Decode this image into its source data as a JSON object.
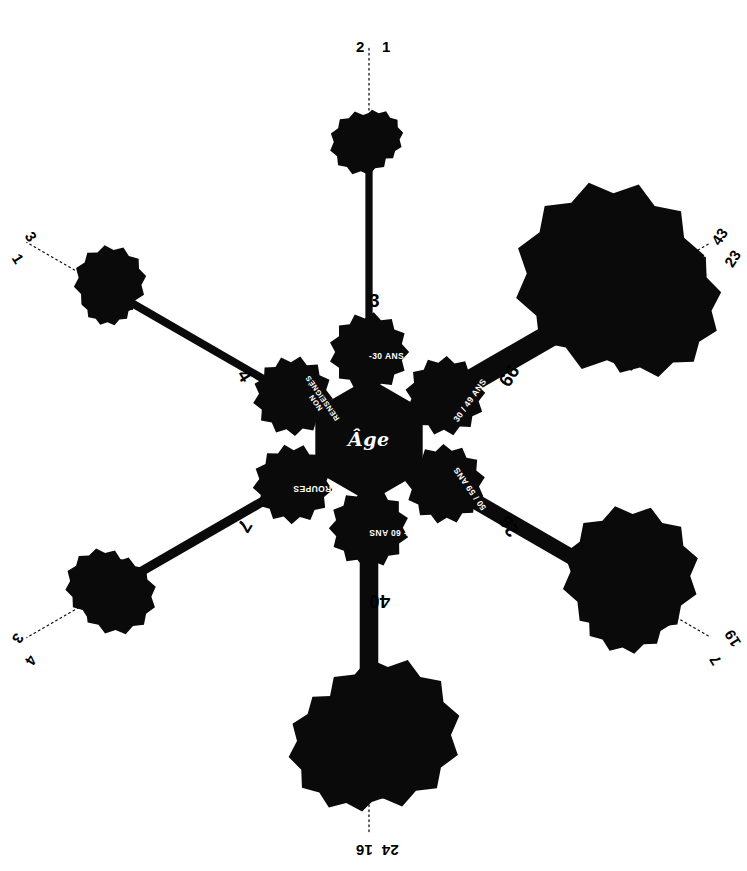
{
  "diagram": {
    "title_center": "Âge",
    "type": "radial-bubble-network",
    "accent_color": "#000000",
    "background_color": "#ffffff"
  },
  "hub": {
    "label": "Âge"
  },
  "nodes": [
    {
      "id": "n-30",
      "label": "-30 ANS",
      "angle_deg": -90,
      "value_main": 3,
      "rotation": 0,
      "lines": [
        "-30 ANS"
      ]
    },
    {
      "id": "n3049",
      "label": "30 / 49 ANS",
      "angle_deg": -30,
      "value_main": 66,
      "rotation": -55,
      "lines": [
        "30 / 49 ANS"
      ]
    },
    {
      "id": "n5059",
      "label": "50 / 59 ANS",
      "angle_deg": 30,
      "value_main": 26,
      "rotation": -125,
      "lines": [
        "50 / 59 ANS"
      ]
    },
    {
      "id": "n60",
      "label": "+ 60 ANS",
      "angle_deg": 90,
      "value_main": 40,
      "rotation": 180,
      "lines": [
        "+ 60 ANS"
      ]
    },
    {
      "id": "ngroupes",
      "label": "GROUPES",
      "angle_deg": 150,
      "value_main": 7,
      "rotation": 180,
      "lines": [
        "GROUPES"
      ]
    },
    {
      "id": "nnonrens",
      "label": "NON RENSEIGNÉS",
      "angle_deg": -150,
      "value_main": 4,
      "rotation": -125,
      "lines": [
        "NON",
        "RENSEIGNÉS"
      ]
    }
  ],
  "axis_end_labels": [
    {
      "axis": "top",
      "values": [
        "2",
        "1"
      ],
      "rotation": 0
    },
    {
      "axis": "top-right",
      "values": [
        "43",
        "23"
      ],
      "rotation": -57
    },
    {
      "axis": "bottom-right",
      "values": [
        "19",
        "7"
      ],
      "rotation": -122
    },
    {
      "axis": "bottom",
      "values": [
        "24",
        "16"
      ],
      "rotation": 180
    },
    {
      "axis": "bottom-left",
      "values": [
        "4",
        "3"
      ],
      "rotation": 122
    },
    {
      "axis": "top-left",
      "values": [
        "1",
        "3"
      ],
      "rotation": 57
    }
  ],
  "axis_mid_labels": [
    {
      "axis": "top",
      "value": "3",
      "rotation": 0
    },
    {
      "axis": "top-right",
      "value": "66",
      "rotation": -57
    },
    {
      "axis": "bottom-right",
      "value": "26",
      "rotation": -122
    },
    {
      "axis": "bottom",
      "value": "40",
      "rotation": 180
    },
    {
      "axis": "bottom-left",
      "value": "7",
      "rotation": 122
    },
    {
      "axis": "top-left",
      "value": "4",
      "rotation": 57
    }
  ],
  "chart_data": {
    "type": "bubble",
    "title": "Âge",
    "xlabel": "",
    "ylabel": "",
    "grid": false,
    "legend_position": "none",
    "categories": [
      "-30 ANS",
      "30 / 49 ANS",
      "50 / 59 ANS",
      "+ 60 ANS",
      "GROUPES",
      "NON RENSEIGNÉS"
    ],
    "node_values": [
      3,
      66,
      26,
      40,
      7,
      4
    ],
    "series": [
      {
        "name": "bubble-a",
        "values": [
          2,
          43,
          19,
          24,
          4,
          1
        ]
      },
      {
        "name": "bubble-b",
        "values": [
          1,
          23,
          7,
          16,
          3,
          3
        ]
      }
    ],
    "annotations": [
      "2 / 1 at top axis end",
      "43 / 23 at top-right axis end",
      "19 / 7 at bottom-right axis end",
      "24 / 16 at bottom axis end",
      "4 / 3 at bottom-left axis end",
      "1 / 3 at top-left axis end"
    ]
  }
}
